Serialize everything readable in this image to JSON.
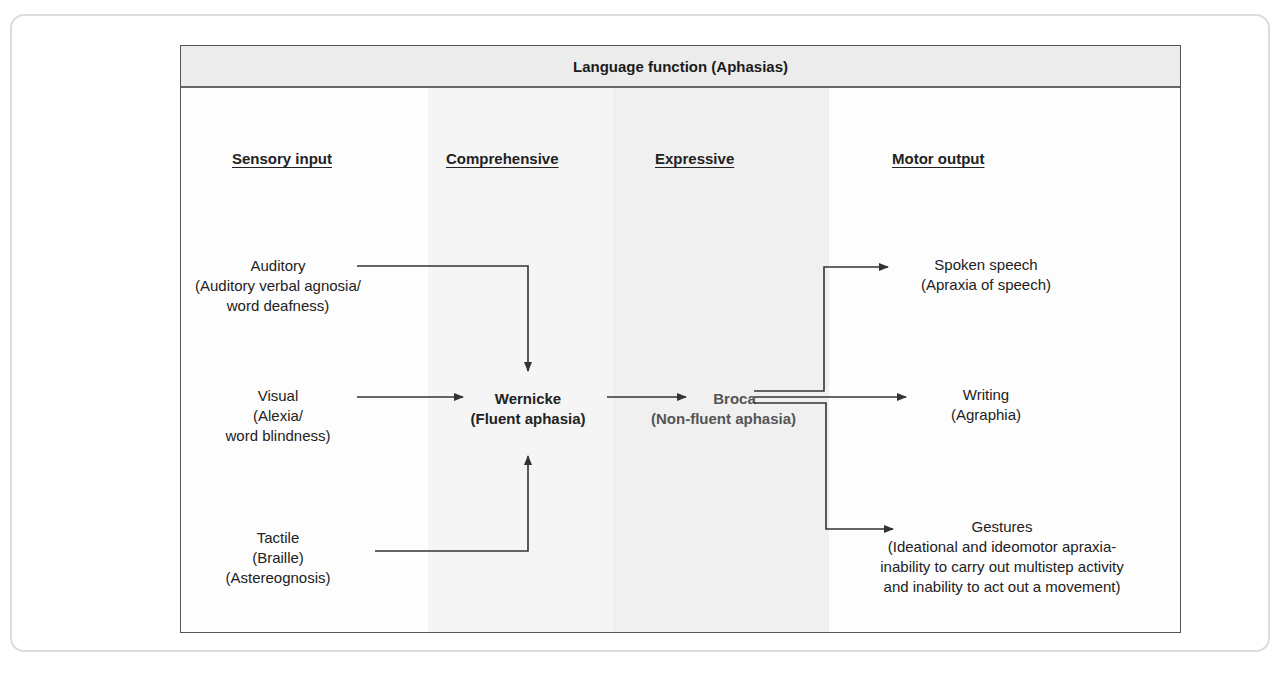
{
  "title": "Language function (Aphasias)",
  "columns": [
    {
      "id": "sensory",
      "label": "Sensory input"
    },
    {
      "id": "comprehensive",
      "label": "Comprehensive"
    },
    {
      "id": "expressive",
      "label": "Expressive"
    },
    {
      "id": "motor",
      "label": "Motor output"
    }
  ],
  "sensory_inputs": [
    {
      "label": "Auditory",
      "detail": [
        "(Auditory verbal agnosia/",
        "word deafness)"
      ]
    },
    {
      "label": "Visual",
      "detail": [
        "(Alexia/",
        "word blindness)"
      ]
    },
    {
      "label": "Tactile",
      "detail": [
        "(Braille)",
        "(Astereognosis)"
      ]
    }
  ],
  "wernicke": {
    "label": "Wernicke",
    "detail": "(Fluent aphasia)"
  },
  "broca": {
    "label": "Broca",
    "detail": "(Non-fluent aphasia)"
  },
  "motor_outputs": [
    {
      "label": "Spoken speech",
      "detail": [
        "(Apraxia of speech)"
      ]
    },
    {
      "label": "Writing",
      "detail": [
        "(Agraphia)"
      ]
    },
    {
      "label": "Gestures",
      "detail": [
        "(Ideational and ideomotor apraxia-",
        "inability to carry out multistep activity",
        "and inability to act out a movement)"
      ]
    }
  ],
  "colors": {
    "header_bg": "#ececec",
    "border": "#555555",
    "arrow": "#333333",
    "broca_text": "#555555",
    "band_comprehensive": "#f5f5f5",
    "band_expressive": "#f0f0f0"
  }
}
